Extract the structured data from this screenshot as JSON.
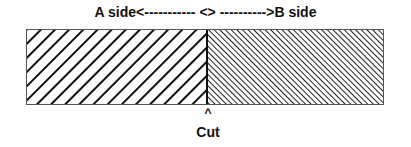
{
  "title": {
    "text": "A side<----------- <> ---------->B side",
    "left_label": "A side",
    "right_label": "B side"
  },
  "diagram": {
    "left_region": {
      "name": "A side",
      "pattern": "diagonal-hatch-wide",
      "direction": "top-left to bottom-right"
    },
    "right_region": {
      "name": "B side",
      "pattern": "diagonal-hatch-fine",
      "direction": "bottom-left to top-right"
    },
    "divider": "cut line",
    "colors": {
      "stroke": "#111111",
      "background": "#ffffff",
      "border": "#555555"
    }
  },
  "marker": {
    "caret": "^",
    "label": "Cut"
  }
}
